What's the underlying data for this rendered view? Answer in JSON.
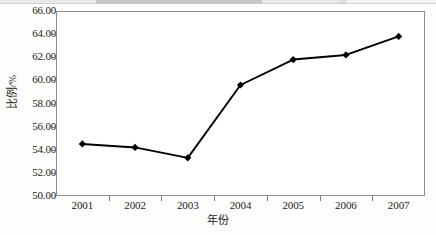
{
  "chart_data": {
    "type": "line",
    "title": "",
    "xlabel": "年份",
    "ylabel": "比例/%",
    "categories": [
      "2001",
      "2002",
      "2003",
      "2004",
      "2005",
      "2006",
      "2007"
    ],
    "values": [
      54.5,
      54.2,
      53.3,
      59.6,
      61.8,
      62.2,
      63.8
    ],
    "series": [
      {
        "name": "比例",
        "values": [
          54.5,
          54.2,
          53.3,
          59.6,
          61.8,
          62.2,
          63.8
        ]
      }
    ],
    "ylim": [
      50.0,
      66.0
    ],
    "ytick_labels": [
      "50.00",
      "52.00",
      "54.00",
      "56.00",
      "58.00",
      "60.00",
      "62.00",
      "64.00",
      "66.00"
    ],
    "ytick_values": [
      50.0,
      52.0,
      54.0,
      56.0,
      58.0,
      60.0,
      62.0,
      64.0,
      66.0
    ],
    "xtick_labels": [
      "2001",
      "2002",
      "2003",
      "2004",
      "2005",
      "2006",
      "2007"
    ],
    "grid": false,
    "legend": false,
    "legend_position": "none",
    "marker": "diamond",
    "marker_color": "#000000",
    "line_color": "#000000",
    "plot_background": "#ffffff",
    "frame_color": "#8d8d8d"
  }
}
